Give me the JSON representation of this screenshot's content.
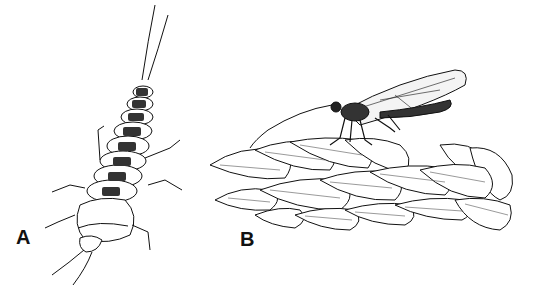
{
  "figure": {
    "panels": [
      {
        "label": "A",
        "subject": "larva, dorsal view"
      },
      {
        "label": "B",
        "subject": "adult on grass seed head, lateral view"
      }
    ],
    "colors": {
      "ink": "#111111",
      "background": "#ffffff"
    }
  }
}
